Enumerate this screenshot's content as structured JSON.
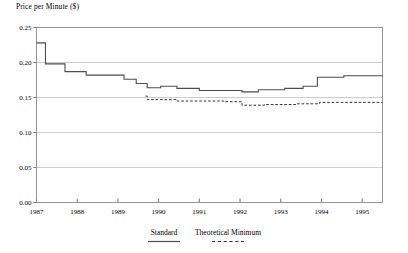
{
  "chart_data": {
    "type": "line",
    "title": "",
    "ylabel": "Price per Minute ($)",
    "xlabel": "",
    "xlim": [
      1987.0,
      1995.5
    ],
    "ylim": [
      0.0,
      0.25
    ],
    "ytick_labels": [
      "0.00",
      "0.05",
      "0.10",
      "0.15",
      "0.20",
      "0.25"
    ],
    "ytick_values": [
      0.0,
      0.05,
      0.1,
      0.15,
      0.2,
      0.25
    ],
    "xtick_labels": [
      "1987",
      "1988",
      "1989",
      "1990",
      "1991",
      "1992",
      "1993",
      "1994",
      "1995"
    ],
    "xtick_values": [
      1987,
      1988,
      1989,
      1990,
      1991,
      1992,
      1993,
      1994,
      1995
    ],
    "grid": "horizontal",
    "legend_position": "bottom-center",
    "step_style": "post",
    "series": [
      {
        "name": "Standard",
        "style": "solid",
        "color": "#4d4d4d",
        "points": [
          [
            1987.0,
            0.228
          ],
          [
            1987.22,
            0.228
          ],
          [
            1987.22,
            0.198
          ],
          [
            1987.7,
            0.198
          ],
          [
            1987.7,
            0.187
          ],
          [
            1988.22,
            0.187
          ],
          [
            1988.22,
            0.182
          ],
          [
            1989.15,
            0.182
          ],
          [
            1989.15,
            0.176
          ],
          [
            1989.45,
            0.176
          ],
          [
            1989.45,
            0.17
          ],
          [
            1989.72,
            0.17
          ],
          [
            1989.72,
            0.164
          ],
          [
            1990.05,
            0.164
          ],
          [
            1990.05,
            0.166
          ],
          [
            1990.45,
            0.166
          ],
          [
            1990.45,
            0.163
          ],
          [
            1991.0,
            0.163
          ],
          [
            1991.0,
            0.16
          ],
          [
            1992.05,
            0.16
          ],
          [
            1992.05,
            0.158
          ],
          [
            1992.45,
            0.158
          ],
          [
            1992.45,
            0.161
          ],
          [
            1993.1,
            0.161
          ],
          [
            1993.1,
            0.163
          ],
          [
            1993.55,
            0.163
          ],
          [
            1993.55,
            0.166
          ],
          [
            1993.9,
            0.166
          ],
          [
            1993.9,
            0.179
          ],
          [
            1994.55,
            0.179
          ],
          [
            1994.55,
            0.181
          ],
          [
            1995.5,
            0.181
          ]
        ]
      },
      {
        "name": "Theoretical Minimum",
        "style": "dashed",
        "color": "#333333",
        "points": [
          [
            1989.68,
            0.152
          ],
          [
            1989.72,
            0.152
          ],
          [
            1989.72,
            0.147
          ],
          [
            1990.45,
            0.147
          ],
          [
            1990.45,
            0.145
          ],
          [
            1991.6,
            0.145
          ],
          [
            1991.6,
            0.144
          ],
          [
            1992.05,
            0.144
          ],
          [
            1992.05,
            0.139
          ],
          [
            1992.6,
            0.139
          ],
          [
            1992.6,
            0.14
          ],
          [
            1993.4,
            0.14
          ],
          [
            1993.4,
            0.141
          ],
          [
            1993.95,
            0.141
          ],
          [
            1993.95,
            0.143
          ],
          [
            1995.5,
            0.143
          ]
        ]
      }
    ]
  },
  "legend": {
    "entries": [
      {
        "label": "Standard",
        "style": "solid"
      },
      {
        "label": "Theoretical Minimum",
        "style": "dashed"
      }
    ]
  }
}
